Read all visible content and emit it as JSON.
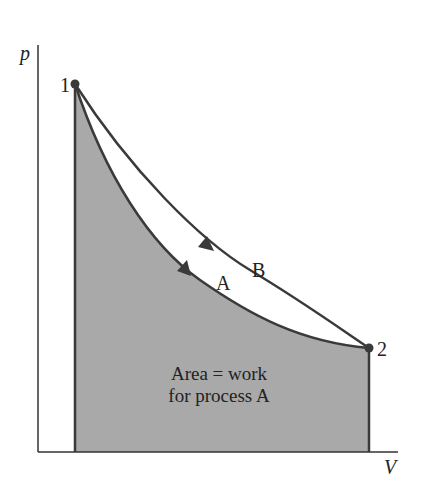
{
  "diagram": {
    "type": "p-V diagram",
    "axes": {
      "y_label": "p",
      "x_label": "V"
    },
    "points": [
      {
        "label": "1",
        "x": 75,
        "y": 84
      },
      {
        "label": "2",
        "x": 369,
        "y": 348
      }
    ],
    "processes": [
      {
        "label": "A",
        "description": "lower curve, shaded area beneath"
      },
      {
        "label": "B",
        "description": "upper curve"
      }
    ],
    "annotation": {
      "line1": "Area = work",
      "line2": "for process A"
    },
    "colors": {
      "shade": "#a9a9a9",
      "line": "#3a3a3a",
      "axis": "#333333",
      "background": "#ffffff"
    }
  }
}
